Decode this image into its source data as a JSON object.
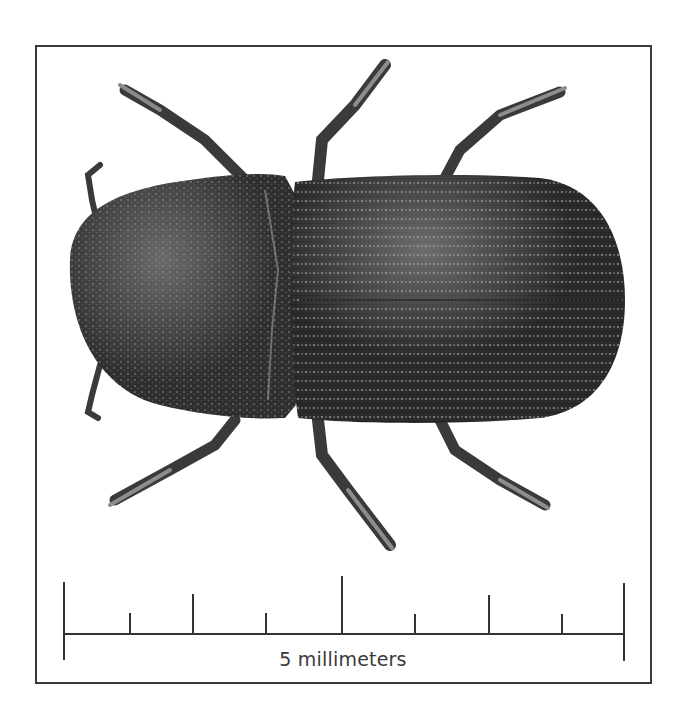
{
  "figure": {
    "background_color": "#ffffff",
    "frame_color": "#3a3a3a",
    "specimen_color": "#2e2e2e"
  },
  "scale_bar": {
    "label": "5 millimeters",
    "length_mm": 5,
    "major_ticks": 3,
    "minor_ticks": 8,
    "color": "#333333"
  }
}
